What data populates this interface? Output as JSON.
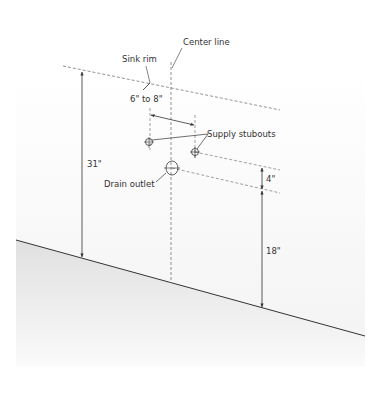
{
  "diagram": {
    "labels": {
      "sink_rim": "Sink rim",
      "center_line": "Center line",
      "spacing": "6\" to 8\"",
      "supply_stubouts": "Supply stubouts",
      "drain_outlet": "Drain outlet",
      "rim_height": "31\"",
      "stubout_offset": "4\"",
      "drain_height": "18\""
    },
    "colors": {
      "line": "#333333",
      "dashed": "#777777",
      "floor_top": "#e2e2e2",
      "floor_bottom": "#fbfbfb",
      "wall": "#f7f7f7"
    }
  }
}
